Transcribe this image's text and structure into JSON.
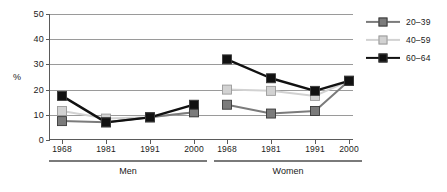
{
  "chart_data": {
    "type": "line",
    "title": "",
    "xlabel": "",
    "ylabel": "%",
    "ylim": [
      0,
      50
    ],
    "yticks": [
      0,
      10,
      20,
      30,
      40,
      50
    ],
    "grid": true,
    "legend_position": "right",
    "panels": [
      {
        "name": "Men",
        "categories": [
          "1968",
          "1981",
          "1991",
          "2000"
        ]
      },
      {
        "name": "Women",
        "categories": [
          "1968",
          "1981",
          "1991",
          "2000"
        ]
      }
    ],
    "series": [
      {
        "name": "20–39",
        "color": "#7b7b7b",
        "marker": "square",
        "values": {
          "Men": [
            7.5,
            7.0,
            9.0,
            11.0
          ],
          "Women": [
            14.0,
            10.5,
            11.5,
            23.5
          ]
        }
      },
      {
        "name": "40–59",
        "color": "#d2d2d2",
        "marker": "square",
        "values": {
          "Men": [
            11.5,
            8.5,
            9.0,
            11.0
          ],
          "Women": [
            20.0,
            19.5,
            17.5,
            23.5
          ]
        }
      },
      {
        "name": "60–64",
        "color": "#111111",
        "marker": "square",
        "values": {
          "Men": [
            17.5,
            7.0,
            9.0,
            14.0
          ],
          "Women": [
            32.0,
            24.5,
            19.5,
            23.5
          ]
        }
      }
    ]
  },
  "axis": {
    "y_label": "%",
    "y_ticks": [
      "0",
      "10",
      "20",
      "30",
      "40",
      "50"
    ]
  },
  "panels": {
    "men": {
      "label": "Men",
      "years": [
        "1968",
        "1981",
        "1991",
        "2000"
      ]
    },
    "women": {
      "label": "Women",
      "years": [
        "1968",
        "1981",
        "1991",
        "2000"
      ]
    }
  },
  "legend": {
    "items": [
      {
        "label": "20–39",
        "color": "#7b7b7b"
      },
      {
        "label": "40–59",
        "color": "#d2d2d2"
      },
      {
        "label": "60–64",
        "color": "#111111"
      }
    ]
  },
  "colors": {
    "series_20_39": "#7b7b7b",
    "series_40_59": "#d2d2d2",
    "series_60_64": "#111111",
    "gridline": "#9a9a9a",
    "axis": "#5a5a5a",
    "background": "#ffffff"
  }
}
